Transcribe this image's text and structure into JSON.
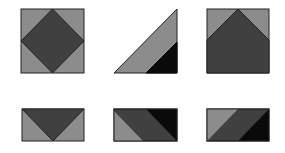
{
  "figure": {
    "colors": {
      "light_gray": "#8c8c8c",
      "dark_gray": "#404040",
      "black": "#0a0a0a",
      "outline": "#222222",
      "background": "#ffffff"
    },
    "tiles": [
      {
        "name": "square-with-diamond",
        "row": 1,
        "col": 1
      },
      {
        "name": "right-triangle-with-black-corner",
        "row": 1,
        "col": 2
      },
      {
        "name": "square-with-peak",
        "row": 1,
        "col": 3
      },
      {
        "name": "rectangle-with-inverted-triangle",
        "row": 2,
        "col": 1
      },
      {
        "name": "rectangle-with-diagonal-bands-a",
        "row": 2,
        "col": 2
      },
      {
        "name": "rectangle-with-diagonal-bands-b",
        "row": 2,
        "col": 3
      }
    ]
  }
}
